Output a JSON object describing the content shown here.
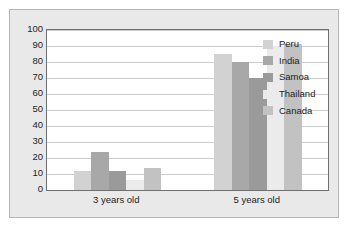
{
  "chart_data": {
    "type": "bar",
    "title": "",
    "xlabel": "",
    "ylabel": "",
    "categories": [
      "3 years old",
      "5 years old"
    ],
    "series": [
      {
        "name": "Peru",
        "color": "#d2d2d2",
        "values": [
          12,
          85
        ]
      },
      {
        "name": "India",
        "color": "#a8a8a8",
        "values": [
          24,
          80
        ]
      },
      {
        "name": "Samoa",
        "color": "#9a9a9a",
        "values": [
          12,
          70
        ]
      },
      {
        "name": "Thailand",
        "color": "#ebebeb",
        "values": [
          6,
          90
        ]
      },
      {
        "name": "Canada",
        "color": "#c2c2c2",
        "values": [
          14,
          91
        ]
      }
    ],
    "ylim": [
      0,
      100
    ],
    "ytick_step": 10,
    "yticks": [
      "100",
      "90",
      "80",
      "70",
      "60",
      "50",
      "40",
      "30",
      "20",
      "10",
      "0"
    ],
    "grid": true,
    "legend_position": "inside-top-right"
  },
  "legend": {
    "items": [
      {
        "label": "Peru"
      },
      {
        "label": "India"
      },
      {
        "label": "Samoa"
      },
      {
        "label": "Thailand"
      },
      {
        "label": "Canada"
      }
    ]
  },
  "colors": {
    "panel_background": "#e9e9e9",
    "panel_border": "#b5b5b5",
    "plot_background": "#ffffff",
    "plot_border": "#6f6f6f",
    "gridline": "#cccccc",
    "text": "#1d1d1d"
  }
}
